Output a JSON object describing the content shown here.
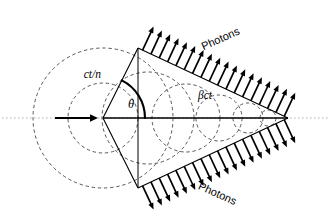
{
  "figure": {
    "name": "cherenkov-radiation-cone-diagram",
    "domain": "Diagram",
    "width": 330,
    "height": 224,
    "background_color": "#ffffff"
  },
  "labels": {
    "ct_over_n": "ct/n",
    "beta_ct": "βct",
    "theta": "θ",
    "photons_top": "Photons",
    "photons_bottom": "Photons"
  },
  "colors": {
    "stroke_solid": "#000000",
    "stroke_dashed": "#444444",
    "axis_dotted": "#b9b2a4",
    "background": "#ffffff"
  },
  "geometry": {
    "apex": {
      "x": 288,
      "y": 118
    },
    "emission_origin": {
      "x": 103,
      "y": 118
    },
    "cone_upper_vertex": {
      "x": 138,
      "y": 48
    },
    "cone_lower_vertex": {
      "x": 138,
      "y": 188
    },
    "theta_arc_radius": 42,
    "theta_degrees": 63,
    "wavefront_radius_large": 70,
    "particle_arrow": {
      "x1": 55,
      "y1": 118,
      "x2": 98,
      "y2": 118
    },
    "axis_line": {
      "x1": 2,
      "y1": 118,
      "x2": 328,
      "y2": 118
    }
  },
  "wavefront_circles": [
    {
      "cx": 103,
      "cy": 118,
      "r": 70
    },
    {
      "cx": 103,
      "cy": 118,
      "r": 35
    },
    {
      "cx": 148,
      "cy": 118,
      "r": 46
    },
    {
      "cx": 186,
      "cy": 118,
      "r": 34
    },
    {
      "cx": 219,
      "cy": 118,
      "r": 23
    },
    {
      "cx": 248,
      "cy": 118,
      "r": 15
    },
    {
      "cx": 268,
      "cy": 118,
      "r": 8
    }
  ],
  "photon_arrows": {
    "count_top": 18,
    "count_bottom": 18,
    "length": 26,
    "direction_top_deg": -70,
    "direction_bottom_deg": 70
  },
  "label_positions": {
    "ct_over_n": {
      "x": 101,
      "y": 78,
      "rotate": 0
    },
    "theta": {
      "x": 131,
      "y": 107,
      "rotate": 0
    },
    "beta_ct": {
      "x": 205,
      "y": 98,
      "rotate": 0
    },
    "photons_top": {
      "x": 222,
      "y": 42,
      "rotate": -24
    },
    "photons_bottom": {
      "x": 215,
      "y": 196,
      "rotate": 24
    }
  }
}
